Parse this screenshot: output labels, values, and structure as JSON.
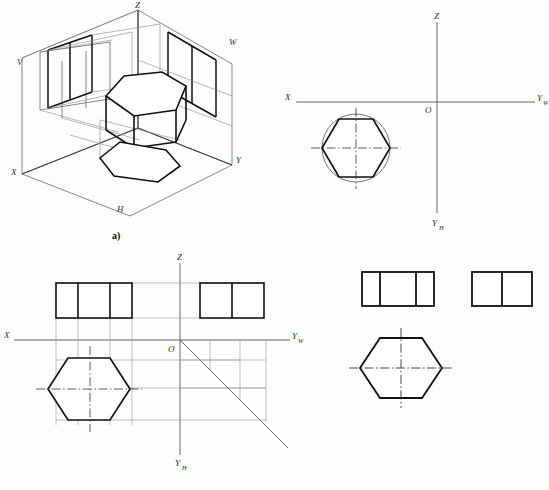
{
  "sheet": {
    "title": "Hexagonal Prism Three-View Orthographic Projection",
    "background_color": "#fdfdfd",
    "ink_color": "#111111",
    "thin_ink_color": "#555555",
    "centerline_color": "#333333"
  },
  "captions": {
    "a": "a)",
    "b": "b)",
    "c": "c)",
    "d": "d)"
  },
  "panel_a": {
    "name": "three-projection-plane-box-with-hexagonal-prism",
    "description": "Isometric projection box with V, H and W planes containing a hexagonal prism and its projections",
    "labels": {
      "z": "Z",
      "x": "X",
      "y": "Y",
      "v": "V",
      "w": "W",
      "h": "H"
    }
  },
  "panel_b": {
    "name": "projection-axes-with-top-view-hexagon",
    "description": "Projection axis system with hexagon inscribed in a circle placed in the H quadrant",
    "labels": {
      "z": "Z",
      "x": "X",
      "o": "O",
      "yw_main": "Y",
      "yw_sub": "W",
      "yh_main": "Y",
      "yh_sub": "H"
    }
  },
  "panel_c": {
    "name": "three-view-layout-with-miter-line",
    "description": "Front view, side view and top view laid out about the projection axes with 45 degree miter line",
    "labels": {
      "z": "Z",
      "x": "X",
      "o": "O",
      "yw_main": "Y",
      "yw_sub": "W",
      "yh_main": "Y",
      "yh_sub": "H"
    },
    "front_view_cells": 3,
    "side_view_cells": 2
  },
  "panel_d": {
    "name": "final-three-views",
    "description": "Completed three views: front view with three cells, side view with two cells, top view hexagon with centerlines",
    "front_view_cells": 3,
    "side_view_cells": 2
  }
}
